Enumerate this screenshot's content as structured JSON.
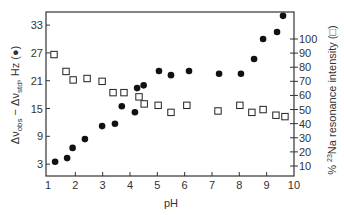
{
  "chart_data": {
    "type": "scatter",
    "title": "",
    "xlabel": "pH",
    "ylabel": "Δν_obs − Δν_std, Hz (●)",
    "y2label": "% ²³Na resonance intensity (□)",
    "xlim": [
      1,
      10
    ],
    "ylim": [
      0,
      35
    ],
    "y2lim": [
      0,
      110
    ],
    "x_ticks": [
      1,
      2,
      3,
      4,
      5,
      6,
      7,
      8,
      9,
      10
    ],
    "y_ticks": [
      3,
      9,
      15,
      21,
      27,
      33
    ],
    "y2_ticks": [
      10,
      20,
      30,
      40,
      50,
      60,
      70,
      80,
      90,
      100
    ],
    "grid": false,
    "series": [
      {
        "name": "Δν_obs − Δν_std (Hz)",
        "marker": "filled-circle",
        "axis": "left",
        "x": [
          1.26,
          1.7,
          1.9,
          2.35,
          2.98,
          3.45,
          3.7,
          4.18,
          4.26,
          4.5,
          5.06,
          5.5,
          6.16,
          7.26,
          8.06,
          8.54,
          8.87,
          9.38,
          9.6
        ],
        "y": [
          3.5,
          4.3,
          6.5,
          8.4,
          11.2,
          11.7,
          15.5,
          14.2,
          19.4,
          20.0,
          23.1,
          22.2,
          23.1,
          22.5,
          22.5,
          25.7,
          30.0,
          31.5,
          35.0
        ]
      },
      {
        "name": "% 23Na resonance intensity",
        "marker": "open-square",
        "axis": "right",
        "x": [
          1.22,
          1.66,
          1.92,
          2.43,
          2.98,
          3.38,
          3.78,
          4.33,
          4.52,
          5.03,
          5.5,
          6.08,
          7.22,
          8.02,
          8.46,
          8.87,
          9.34,
          9.67
        ],
        "y": [
          89,
          77,
          71,
          72,
          70,
          62,
          62,
          59,
          54,
          53,
          48,
          53,
          49,
          53,
          48,
          50,
          46,
          45
        ]
      }
    ]
  },
  "labels": {
    "xlabel": "pH",
    "ylabel_main": "Δν",
    "ylabel_sub_obs": "obs",
    "ylabel_minus": " − Δν",
    "ylabel_sub_std": "std",
    "ylabel_unit": ", Hz (●)",
    "y2label_pre": "% ",
    "y2label_sup": "23",
    "y2label_post": "Na resonance intensity (□)"
  }
}
